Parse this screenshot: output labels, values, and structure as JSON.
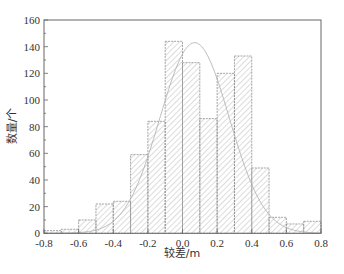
{
  "chart_data": {
    "type": "bar",
    "subtype": "histogram_with_normal_fit",
    "title": "",
    "xlabel": "较差/m",
    "ylabel": "数量/个",
    "xlim": [
      -0.8,
      0.8
    ],
    "ylim": [
      0,
      160
    ],
    "x_ticks": [
      "-0.8",
      "-0.6",
      "-0.4",
      "-0.2",
      "0.0",
      "0.2",
      "0.4",
      "0.6",
      "0.8"
    ],
    "y_ticks": [
      "0",
      "20",
      "40",
      "60",
      "80",
      "100",
      "120",
      "140",
      "160"
    ],
    "bin_edges": [
      -0.8,
      -0.7,
      -0.6,
      -0.5,
      -0.4,
      -0.3,
      -0.2,
      -0.1,
      0.0,
      0.1,
      0.2,
      0.3,
      0.4,
      0.5,
      0.6,
      0.7,
      0.8
    ],
    "categories": [
      "-0.8~-0.7",
      "-0.7~-0.6",
      "-0.6~-0.5",
      "-0.5~-0.4",
      "-0.4~-0.3",
      "-0.3~-0.2",
      "-0.2~-0.1",
      "-0.1~0.0",
      "0.0~0.1",
      "0.1~0.2",
      "0.2~0.3",
      "0.3~0.4",
      "0.4~0.5",
      "0.5~0.6",
      "0.6~0.7",
      "0.7~0.8"
    ],
    "values": [
      2,
      3,
      10,
      22,
      24,
      59,
      84,
      144,
      128,
      86,
      120,
      133,
      49,
      12,
      7,
      9
    ],
    "fit_curve": {
      "type": "normal",
      "mean": 0.07,
      "peak": 143,
      "sigma": 0.2
    },
    "grid": false,
    "legend": null,
    "colors": {
      "bar_fill": "#ffffff",
      "hatch": "#9a9a9a",
      "bar_edge": "#8a8a8a",
      "curve": "#b0b0b0",
      "axis": "#555555"
    }
  }
}
